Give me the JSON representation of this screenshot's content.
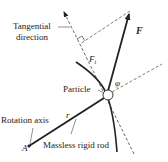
{
  "diagram": {
    "labels": {
      "tangential_line1": "Tangential",
      "tangential_line2": "direction",
      "force": "F",
      "tangential_force_main": "F",
      "tangential_force_sub": "t",
      "angle": "φ",
      "particle": "Particle",
      "rotation_axis": "Rotation axis",
      "radius": "r",
      "point": "A",
      "rod": "Massless rigid rod"
    },
    "colors": {
      "ink": "#222222",
      "dashed": "#444444",
      "particle_fill": "#ffffff",
      "background": "#ffffff"
    }
  }
}
